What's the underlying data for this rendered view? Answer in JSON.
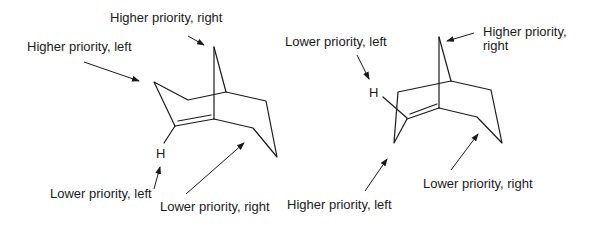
{
  "diagram": {
    "left_molecule": {
      "atom_label": "H",
      "labels": {
        "higher_right": "Higher priority, right",
        "higher_left": "Higher priority, left",
        "lower_left": "Lower priority, left",
        "lower_right": "Lower priority, right"
      }
    },
    "right_molecule": {
      "atom_label": "H",
      "labels": {
        "lower_left": "Lower priority, left",
        "higher_right_line1": "Higher priority,",
        "higher_right_line2": "right",
        "lower_right": "Lower priority, right",
        "higher_left": "Higher priority, left"
      }
    },
    "colors": {
      "ink": "#1a1a1a",
      "background": "#ffffff"
    }
  }
}
